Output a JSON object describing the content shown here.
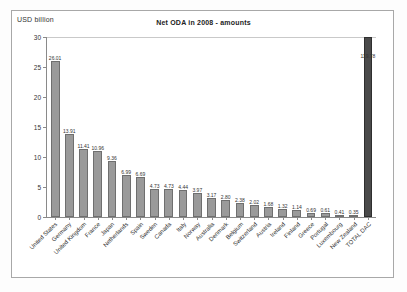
{
  "figure": {
    "unit_label": "USD billion"
  },
  "chart_data": {
    "type": "bar",
    "title": "Net ODA  in 2008 - amounts",
    "xlabel": "",
    "ylabel": "USD billion",
    "ylim": [
      0,
      30
    ],
    "yticks": [
      0,
      5,
      10,
      15,
      20,
      25,
      30
    ],
    "ytick_labels": [
      "0",
      "5",
      "10",
      "15",
      "20",
      "25",
      "30"
    ],
    "grid": false,
    "legend": "none",
    "note": "TOTAL DAC bar is clipped by the y-axis maximum of 30; its data label reads 119.78",
    "categories": [
      "United States",
      "Germany",
      "United Kingdom",
      "France",
      "Japan",
      "Netherlands",
      "Spain",
      "Sweden",
      "Canada",
      "Italy",
      "Norway",
      "Australia",
      "Denmark",
      "Belgium",
      "Switzerland",
      "Austria",
      "Ireland",
      "Finland",
      "Greece",
      "Portugal",
      "Luxembourg",
      "New Zealand",
      "TOTAL DAC"
    ],
    "values": [
      26.01,
      13.91,
      11.41,
      10.96,
      9.36,
      6.99,
      6.69,
      4.73,
      4.73,
      4.44,
      3.97,
      3.17,
      2.8,
      2.38,
      2.02,
      1.68,
      1.32,
      1.14,
      0.69,
      0.61,
      0.41,
      0.35,
      119.78
    ],
    "value_labels": [
      "26.01",
      "13.91",
      "11.41",
      "10.96",
      "9.36",
      "6.99",
      "6.69",
      "4.73",
      "4.73",
      "4.44",
      "3.97",
      "3.17",
      "2.80",
      "2.38",
      "2.02",
      "1.68",
      "1.32",
      "1.14",
      "0.69",
      "0.61",
      "0.41",
      "0.35",
      "119.78"
    ],
    "colors": {
      "bar_fill": "#9a9a9a",
      "bar_border": "#6f6f6f",
      "total_fill": "#4a4a4a",
      "total_border": "#2e2e2e",
      "axis": "#8a8a8a",
      "text": "#333333",
      "frame": "#a8a8a8"
    }
  }
}
